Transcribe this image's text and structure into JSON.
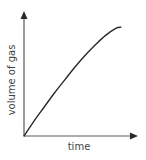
{
  "chart_data": {
    "type": "line",
    "title": "",
    "xlabel": "time",
    "ylabel": "volume of gas",
    "xlim": [
      0,
      1
    ],
    "ylim": [
      0,
      1
    ],
    "grid": false,
    "legend": "none",
    "x_ticks": [],
    "y_ticks": [],
    "series": [
      {
        "name": "volume of gas over time",
        "x": [
          0,
          0.1,
          0.2,
          0.3,
          0.4,
          0.5,
          0.6,
          0.7,
          0.8,
          0.9,
          0.95
        ],
        "y": [
          0,
          0.13,
          0.25,
          0.37,
          0.48,
          0.59,
          0.69,
          0.78,
          0.86,
          0.92,
          0.93
        ]
      }
    ],
    "colors": {
      "axis": "#5a5a5a",
      "line": "#2a2a2a",
      "text": "#444444"
    }
  }
}
